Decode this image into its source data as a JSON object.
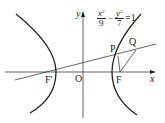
{
  "figure": {
    "type": "hyperbola-diagram",
    "equation": {
      "term1_num": "x",
      "term1_exp": "2",
      "term1_den": "9",
      "minus": "−",
      "term2_num": "y",
      "term2_exp": "2",
      "term2_den": "7",
      "rhs": "=1"
    },
    "axes": {
      "x_label": "x",
      "y_label": "y",
      "origin_label": "O"
    },
    "points": {
      "F_prime": "F′",
      "F": "F",
      "P": "P",
      "Q": "Q"
    },
    "colors": {
      "stroke": "#222222",
      "background": "#ffffff"
    }
  }
}
